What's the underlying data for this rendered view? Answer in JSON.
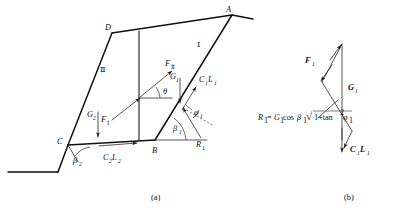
{
  "figure": {
    "caption_a": "(a)",
    "caption_b": "(b)"
  },
  "panel_a": {
    "name": "wedge-geometry-panel",
    "vertices": [
      {
        "id": "A",
        "label": "A"
      },
      {
        "id": "D",
        "label": "D"
      },
      {
        "id": "B",
        "label": "B"
      },
      {
        "id": "C",
        "label": "C"
      }
    ],
    "blocks": [
      {
        "id": "I",
        "label": "Ⅰ"
      },
      {
        "id": "II",
        "label": "Ⅱ"
      }
    ],
    "angles": [
      {
        "id": "theta",
        "label": "θ"
      },
      {
        "id": "beta1",
        "label": "β",
        "sub": "1"
      },
      {
        "id": "beta2",
        "label": "β",
        "sub": "2"
      },
      {
        "id": "phi1",
        "label": "φ",
        "sub": "1"
      }
    ],
    "forces": [
      {
        "id": "F_II",
        "label": "F",
        "sub": "Ⅱ"
      },
      {
        "id": "F_I",
        "label": "F",
        "sub": "Ⅰ"
      },
      {
        "id": "G1",
        "label": "G",
        "sub": "1"
      },
      {
        "id": "G2",
        "label": "G",
        "sub": "2"
      },
      {
        "id": "C1L1",
        "label": "C",
        "sub": "1",
        "label2": "L",
        "sub2": "1"
      },
      {
        "id": "C2L2",
        "label": "C",
        "sub": "2",
        "label2": "L",
        "sub2": "2"
      },
      {
        "id": "R1",
        "label": "R",
        "sub": "1"
      }
    ]
  },
  "panel_b": {
    "name": "force-polygon-panel",
    "forces": [
      {
        "id": "F1",
        "label": "F",
        "sub": "1"
      },
      {
        "id": "G1",
        "label": "G",
        "sub": "1"
      },
      {
        "id": "C1L1",
        "label": "C",
        "sub": "1",
        "label2": "L",
        "sub2": "1"
      }
    ],
    "equation": {
      "lhs": "R",
      "lhs_sub": "1",
      "eq": "=",
      "rhs_1": "G",
      "rhs_1_sub": "1",
      "rhs_cos": "cos",
      "rhs_beta": "β",
      "rhs_beta_sub": "1",
      "radical": "√",
      "rhs_rad_body": "1+tan",
      "rhs_rad_exp": "2",
      "rhs_phi": "φ",
      "rhs_phi_sub": "1",
      "plain": "R₁=G₁cosβ₁√(1+tan²φ₁)"
    }
  },
  "colors": {
    "line": "#1c1c1c",
    "background": "#ffffff",
    "text": "#101010"
  }
}
